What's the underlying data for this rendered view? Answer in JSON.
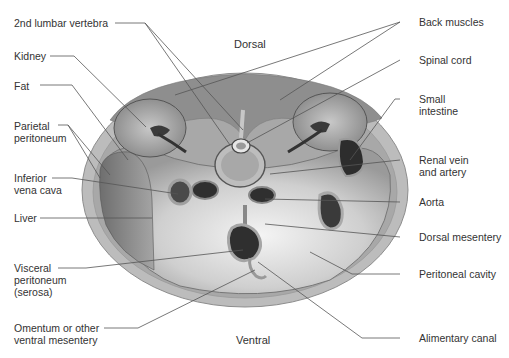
{
  "figure": {
    "type": "anatomical-cross-section",
    "orientation": {
      "top": "Dorsal",
      "bottom": "Ventral"
    },
    "colors": {
      "skin": "#bdbdbd",
      "muscle": "#8c8c8c",
      "cavity": "#d9d9d9",
      "organ_dark": "#3a3a3a",
      "leader_line": "#555555"
    }
  },
  "labels_left": [
    {
      "id": "lumbar",
      "text": "2nd lumbar vertebra"
    },
    {
      "id": "kidney",
      "text": "Kidney"
    },
    {
      "id": "fat",
      "text": "Fat"
    },
    {
      "id": "parietal",
      "text": "Parietal\nperitoneum"
    },
    {
      "id": "ivc",
      "text": "Inferior\nvena cava"
    },
    {
      "id": "liver",
      "text": "Liver"
    },
    {
      "id": "visceral",
      "text": "Visceral\nperitoneum\n(serosa)"
    },
    {
      "id": "omentum",
      "text": "Omentum or other\nventral mesentery"
    }
  ],
  "labels_right": [
    {
      "id": "back",
      "text": "Back muscles"
    },
    {
      "id": "spinal",
      "text": "Spinal cord"
    },
    {
      "id": "smallint",
      "text": "Small\nintestine"
    },
    {
      "id": "renal",
      "text": "Renal vein\nand artery"
    },
    {
      "id": "aorta",
      "text": "Aorta"
    },
    {
      "id": "dorsalmes",
      "text": "Dorsal mesentery"
    },
    {
      "id": "peritoneal",
      "text": "Peritoneal cavity"
    },
    {
      "id": "alimentary",
      "text": "Alimentary canal"
    }
  ]
}
